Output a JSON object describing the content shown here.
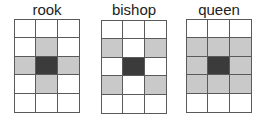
{
  "colors": {
    "empty": "#ffffff",
    "move": "#c9c9c9",
    "piece": "#3b3b3b",
    "border": "#5a5a5a"
  },
  "panels": [
    {
      "title": "rook",
      "rows": 5,
      "cols": 3,
      "cells": [
        [
          "empty",
          "empty",
          "empty"
        ],
        [
          "empty",
          "move",
          "empty"
        ],
        [
          "move",
          "piece",
          "move"
        ],
        [
          "empty",
          "move",
          "empty"
        ],
        [
          "empty",
          "empty",
          "empty"
        ]
      ]
    },
    {
      "title": "bishop",
      "rows": 5,
      "cols": 3,
      "cells": [
        [
          "empty",
          "empty",
          "empty"
        ],
        [
          "move",
          "empty",
          "move"
        ],
        [
          "empty",
          "piece",
          "empty"
        ],
        [
          "move",
          "empty",
          "move"
        ],
        [
          "empty",
          "empty",
          "empty"
        ]
      ]
    },
    {
      "title": "queen",
      "rows": 5,
      "cols": 3,
      "cells": [
        [
          "empty",
          "empty",
          "empty"
        ],
        [
          "move",
          "move",
          "move"
        ],
        [
          "move",
          "piece",
          "move"
        ],
        [
          "move",
          "move",
          "move"
        ],
        [
          "empty",
          "empty",
          "empty"
        ]
      ]
    }
  ]
}
